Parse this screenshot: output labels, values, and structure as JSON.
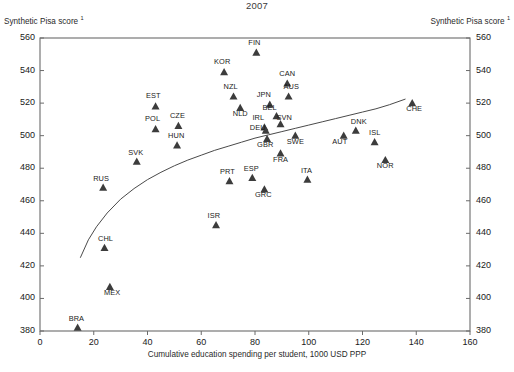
{
  "chart_data": {
    "type": "scatter",
    "title": "2007",
    "xlabel": "Cumulative education spending per student, 1000 USD PPP",
    "ylabel": "Synthetic Pisa score ¹",
    "ylabel_right": "Synthetic Pisa score ¹",
    "xlim": [
      0,
      160
    ],
    "ylim": [
      380,
      560
    ],
    "xticks": [
      0,
      20,
      40,
      60,
      80,
      100,
      120,
      140,
      160
    ],
    "yticks": [
      380,
      400,
      420,
      440,
      460,
      480,
      500,
      520,
      540,
      560
    ],
    "grid": false,
    "legend": null,
    "marker": "triangle-up",
    "marker_color": "#3c3c3c",
    "points": [
      {
        "label": "FIN",
        "x": 80.5,
        "y": 551,
        "lx": -2,
        "ly": -11
      },
      {
        "label": "KOR",
        "x": 68.5,
        "y": 539,
        "lx": -2,
        "ly": -11
      },
      {
        "label": "CAN",
        "x": 92.0,
        "y": 532,
        "lx": 0,
        "ly": -11
      },
      {
        "label": "AUS",
        "x": 92.5,
        "y": 524,
        "lx": 3,
        "ly": -11
      },
      {
        "label": "NZL",
        "x": 72.0,
        "y": 524,
        "lx": -3,
        "ly": -11
      },
      {
        "label": "JPN",
        "x": 85.5,
        "y": 519,
        "lx": -6,
        "ly": -11
      },
      {
        "label": "EST",
        "x": 43.0,
        "y": 518,
        "lx": -2,
        "ly": -11
      },
      {
        "label": "CHE",
        "x": 138.5,
        "y": 520,
        "lx": 2,
        "ly": 5
      },
      {
        "label": "NLD",
        "x": 74.5,
        "y": 517,
        "lx": 0,
        "ly": 5
      },
      {
        "label": "BEL",
        "x": 88.0,
        "y": 512,
        "lx": -7,
        "ly": -9
      },
      {
        "label": "SVN",
        "x": 89.5,
        "y": 507,
        "lx": 4,
        "ly": -7
      },
      {
        "label": "CZE",
        "x": 51.5,
        "y": 506,
        "lx": -1,
        "ly": -11
      },
      {
        "label": "POL",
        "x": 43.0,
        "y": 504,
        "lx": -3,
        "ly": -11
      },
      {
        "label": "IRL",
        "x": 83.5,
        "y": 505,
        "lx": -6,
        "ly": -11
      },
      {
        "label": "DEU",
        "x": 84.0,
        "y": 503,
        "lx": -8,
        "ly": -4
      },
      {
        "label": "DNK",
        "x": 117.5,
        "y": 503,
        "lx": 3,
        "ly": -10
      },
      {
        "label": "AUT",
        "x": 113.0,
        "y": 500,
        "lx": -4,
        "ly": 5
      },
      {
        "label": "SWE",
        "x": 95.0,
        "y": 500,
        "lx": 0,
        "ly": 5
      },
      {
        "label": "GBR",
        "x": 84.5,
        "y": 498,
        "lx": -2,
        "ly": 5
      },
      {
        "label": "ISL",
        "x": 124.5,
        "y": 496,
        "lx": 0,
        "ly": -10
      },
      {
        "label": "HUN",
        "x": 51.0,
        "y": 494,
        "lx": -1,
        "ly": -10
      },
      {
        "label": "FRA",
        "x": 89.5,
        "y": 489,
        "lx": 0,
        "ly": 5
      },
      {
        "label": "SVK",
        "x": 36.0,
        "y": 484,
        "lx": -1,
        "ly": -10
      },
      {
        "label": "NOR",
        "x": 128.5,
        "y": 485,
        "lx": 0,
        "ly": 5
      },
      {
        "label": "ESP",
        "x": 79.0,
        "y": 474,
        "lx": -1,
        "ly": -10
      },
      {
        "label": "PRT",
        "x": 70.5,
        "y": 472,
        "lx": -2,
        "ly": -10
      },
      {
        "label": "ITA",
        "x": 99.5,
        "y": 473,
        "lx": -1,
        "ly": -10
      },
      {
        "label": "GRC",
        "x": 83.5,
        "y": 467,
        "lx": -1,
        "ly": 5
      },
      {
        "label": "RUS",
        "x": 23.5,
        "y": 468,
        "lx": -2,
        "ly": -10
      },
      {
        "label": "ISR",
        "x": 65.5,
        "y": 445,
        "lx": -2,
        "ly": -10
      },
      {
        "label": "CHL",
        "x": 24.0,
        "y": 431,
        "lx": 1,
        "ly": -10
      },
      {
        "label": "MEX",
        "x": 26.0,
        "y": 407,
        "lx": 2,
        "ly": 5
      },
      {
        "label": "BRA",
        "x": 14.0,
        "y": 382,
        "lx": -1,
        "ly": -10
      }
    ],
    "trendline": {
      "name": "fitted-curve",
      "points": [
        [
          15.0,
          425.0
        ],
        [
          18.0,
          436.0
        ],
        [
          21.0,
          444.0
        ],
        [
          25.0,
          452.5
        ],
        [
          30.0,
          461.0
        ],
        [
          35.0,
          467.5
        ],
        [
          40.0,
          473.0
        ],
        [
          45.0,
          477.5
        ],
        [
          50.0,
          481.5
        ],
        [
          55.0,
          485.0
        ],
        [
          60.0,
          488.0
        ],
        [
          65.0,
          491.0
        ],
        [
          70.0,
          493.5
        ],
        [
          75.0,
          496.0
        ],
        [
          80.0,
          498.5
        ],
        [
          85.0,
          500.5
        ],
        [
          90.0,
          502.5
        ],
        [
          95.0,
          504.5
        ],
        [
          100.0,
          506.5
        ],
        [
          105.0,
          508.5
        ],
        [
          110.0,
          510.5
        ],
        [
          115.0,
          512.5
        ],
        [
          120.0,
          514.5
        ],
        [
          125.0,
          516.5
        ],
        [
          130.0,
          519.0
        ],
        [
          136.0,
          522.5
        ]
      ]
    }
  }
}
